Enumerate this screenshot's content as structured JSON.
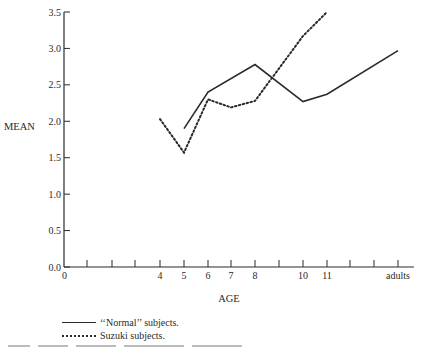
{
  "chart_data": {
    "type": "line",
    "title": "",
    "xlabel": "AGE",
    "ylabel": "MEAN",
    "ylim": [
      0.0,
      3.5
    ],
    "yticks": [
      "0.0",
      "0.5",
      "1.0",
      "1.5",
      "2.0",
      "2.5",
      "3.0",
      "3.5"
    ],
    "xtick_labels": [
      "0",
      "4",
      "5",
      "6",
      "7",
      "8",
      "10",
      "11",
      "adults"
    ],
    "grid": false,
    "legend_position": "below",
    "series": [
      {
        "name": "‘‘Normal’’ subjects.",
        "style": "solid",
        "x": [
          "5",
          "6",
          "8",
          "10",
          "11",
          "adults"
        ],
        "values": [
          1.9,
          2.4,
          2.78,
          2.27,
          2.37,
          2.97
        ]
      },
      {
        "name": "Suzuki subjects.",
        "style": "dotted",
        "x": [
          "4",
          "5",
          "6",
          "7",
          "8",
          "10",
          "11"
        ],
        "values": [
          2.03,
          1.57,
          2.3,
          2.19,
          2.28,
          3.17,
          3.5
        ]
      }
    ]
  },
  "axes": {
    "y_title": "MEAN",
    "x_title": "AGE"
  },
  "legend": {
    "normal_label": "‘‘Normal’’ subjects.",
    "suzuki_label": "Suzuki subjects."
  }
}
